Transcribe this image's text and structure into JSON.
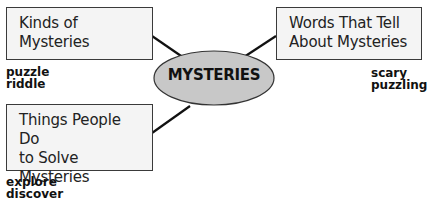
{
  "diagram": {
    "center": {
      "label": "MYSTERIES",
      "fill": "#c8c8c8",
      "stroke": "#333333"
    },
    "branches": [
      {
        "id": "kinds",
        "title_lines": [
          "Kinds of",
          "Mysteries"
        ],
        "words": [
          "puzzle",
          "riddle"
        ]
      },
      {
        "id": "words",
        "title_lines": [
          "Words That Tell",
          "About Mysteries"
        ],
        "words": [
          "scary",
          "puzzling"
        ]
      },
      {
        "id": "things",
        "title_lines": [
          "Things People Do",
          "to Solve",
          "Mysteries"
        ],
        "words": [
          "explore",
          "discover"
        ]
      }
    ],
    "colors": {
      "box_fill": "#f4f4f4",
      "box_border": "#3a3a3a",
      "line": "#111111"
    }
  }
}
